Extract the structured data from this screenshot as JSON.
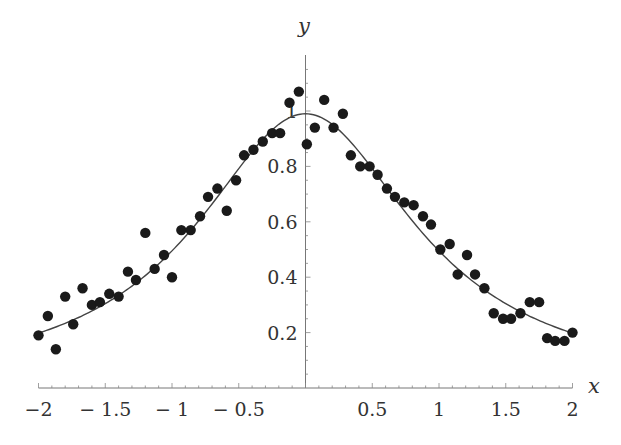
{
  "chart_data": {
    "type": "scatter",
    "title": "",
    "xlabel": "x",
    "ylabel": "y",
    "xlim": [
      -2,
      2
    ],
    "ylim": [
      0,
      1.1
    ],
    "grid": false,
    "legend": null,
    "x_ticks": [
      {
        "value": -2,
        "label": "−2"
      },
      {
        "value": -1.5,
        "label": "− 1.5"
      },
      {
        "value": -1,
        "label": "− 1"
      },
      {
        "value": -0.5,
        "label": "− 0.5"
      },
      {
        "value": 0.5,
        "label": "0.5"
      },
      {
        "value": 1,
        "label": "1"
      },
      {
        "value": 1.5,
        "label": "1.5"
      },
      {
        "value": 2,
        "label": "2"
      }
    ],
    "y_ticks": [
      {
        "value": 0.2,
        "label": "0.2"
      },
      {
        "value": 0.4,
        "label": "0.4"
      },
      {
        "value": 0.6,
        "label": "0.6"
      },
      {
        "value": 0.8,
        "label": "0.8"
      },
      {
        "value": 1,
        "label": "1"
      }
    ],
    "series": [
      {
        "name": "data points",
        "kind": "scatter",
        "color": "#1a1a1a",
        "x": [
          -2.0,
          -1.93,
          -1.87,
          -1.8,
          -1.74,
          -1.67,
          -1.6,
          -1.54,
          -1.47,
          -1.4,
          -1.33,
          -1.27,
          -1.2,
          -1.13,
          -1.06,
          -1.0,
          -0.93,
          -0.86,
          -0.79,
          -0.73,
          -0.66,
          -0.59,
          -0.52,
          -0.46,
          -0.39,
          -0.32,
          -0.25,
          -0.19,
          -0.12,
          -0.05,
          0.01,
          0.07,
          0.14,
          0.21,
          0.28,
          0.34,
          0.41,
          0.48,
          0.54,
          0.61,
          0.67,
          0.74,
          0.81,
          0.88,
          0.94,
          1.01,
          1.08,
          1.14,
          1.21,
          1.27,
          1.34,
          1.41,
          1.48,
          1.54,
          1.61,
          1.68,
          1.75,
          1.81,
          1.87,
          1.94,
          2.0
        ],
        "y": [
          0.19,
          0.26,
          0.14,
          0.33,
          0.23,
          0.36,
          0.3,
          0.31,
          0.34,
          0.33,
          0.42,
          0.39,
          0.56,
          0.43,
          0.48,
          0.4,
          0.57,
          0.57,
          0.62,
          0.69,
          0.72,
          0.64,
          0.75,
          0.84,
          0.86,
          0.89,
          0.92,
          0.92,
          1.03,
          1.07,
          0.88,
          0.94,
          1.04,
          0.94,
          0.99,
          0.84,
          0.8,
          0.8,
          0.77,
          0.72,
          0.69,
          0.67,
          0.66,
          0.62,
          0.59,
          0.5,
          0.52,
          0.41,
          0.48,
          0.41,
          0.36,
          0.27,
          0.25,
          0.25,
          0.27,
          0.31,
          0.31,
          0.18,
          0.17,
          0.17,
          0.2
        ]
      },
      {
        "name": "fitted curve",
        "kind": "line",
        "color": "#444444",
        "function": "y = 1 / (1 + x^2)",
        "x": [
          -2,
          -1.75,
          -1.5,
          -1.25,
          -1,
          -0.75,
          -0.5,
          -0.25,
          0,
          0.25,
          0.5,
          0.75,
          1,
          1.25,
          1.5,
          1.75,
          2
        ],
        "y": [
          0.2,
          0.246,
          0.308,
          0.39,
          0.5,
          0.64,
          0.8,
          0.941,
          1.0,
          0.941,
          0.8,
          0.64,
          0.5,
          0.39,
          0.308,
          0.246,
          0.2
        ]
      }
    ]
  }
}
